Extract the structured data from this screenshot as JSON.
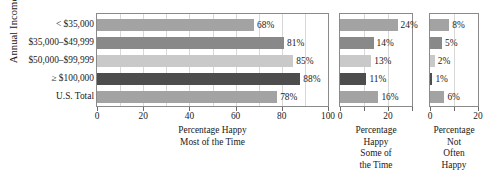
{
  "chart_data": {
    "type": "bar",
    "orientation": "horizontal",
    "title": "",
    "ylabel": "Annual Income",
    "categories": [
      "< $35,000",
      "$35,000–$49,999",
      "$50,000–$99,999",
      "≥ $100,000",
      "U.S. Total"
    ],
    "grid": true,
    "legend": "none",
    "panels": [
      {
        "id": "most-of-the-time",
        "xlabel_lines": [
          "Percentage Happy",
          "Most of the Time"
        ],
        "xlim": [
          0,
          100
        ],
        "xticks": [
          0,
          20,
          40,
          60,
          80,
          100
        ],
        "xticklabels": [
          "0",
          "20",
          "40",
          "60",
          "80",
          "100"
        ],
        "values": [
          68,
          81,
          85,
          88,
          78
        ],
        "datalabels": [
          "68%",
          "81%",
          "85%",
          "88%",
          "78%"
        ]
      },
      {
        "id": "some-of-the-time",
        "xlabel_lines": [
          "Percentage",
          "Happy",
          "Some of",
          "the Time"
        ],
        "xlim": [
          0,
          30
        ],
        "xticks": [
          0,
          20
        ],
        "xticklabels": [
          "0",
          "20"
        ],
        "values": [
          24,
          14,
          13,
          11,
          16
        ],
        "datalabels": [
          "24%",
          "14%",
          "13%",
          "11%",
          "16%"
        ]
      },
      {
        "id": "not-often-happy",
        "xlabel_lines": [
          "Percentage",
          "Not",
          "Often",
          "Happy"
        ],
        "xlim": [
          0,
          20
        ],
        "xticks": [
          0,
          20
        ],
        "xticklabels": [
          "0",
          "20"
        ],
        "values": [
          8,
          5,
          2,
          1,
          6
        ],
        "datalabels": [
          "8%",
          "5%",
          "2%",
          "1%",
          "6%"
        ]
      }
    ],
    "series_colors": [
      "#a3a3a3",
      "#898989",
      "#c9c9c9",
      "#4d4d4d",
      "#a3a3a3"
    ],
    "axis_color": "#8a8a8a",
    "grid_color": "#d8d8d8",
    "text_color": "#1a1a1a"
  }
}
